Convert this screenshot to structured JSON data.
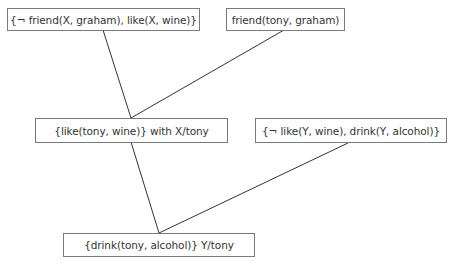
{
  "diagram": {
    "type": "resolution-tree",
    "nodes": [
      {
        "id": "clause1",
        "label": "{¬ friend(X, graham), like(X, wine)}"
      },
      {
        "id": "clause2",
        "label": "friend(tony, graham)"
      },
      {
        "id": "resolvent1",
        "label": "{like(tony, wine)} with X/tony"
      },
      {
        "id": "clause3",
        "label": "{¬ like(Y, wine), drink(Y, alcohol)}"
      },
      {
        "id": "resolvent2",
        "label": "{drink(tony, alcohol)} Y/tony"
      }
    ],
    "edges": [
      {
        "from": "clause1",
        "to": "resolvent1"
      },
      {
        "from": "clause2",
        "to": "resolvent1"
      },
      {
        "from": "resolvent1",
        "to": "resolvent2"
      },
      {
        "from": "clause3",
        "to": "resolvent2"
      }
    ],
    "colors": {
      "line": "#333333",
      "border": "#7a7a7a",
      "text": "#333333"
    }
  }
}
